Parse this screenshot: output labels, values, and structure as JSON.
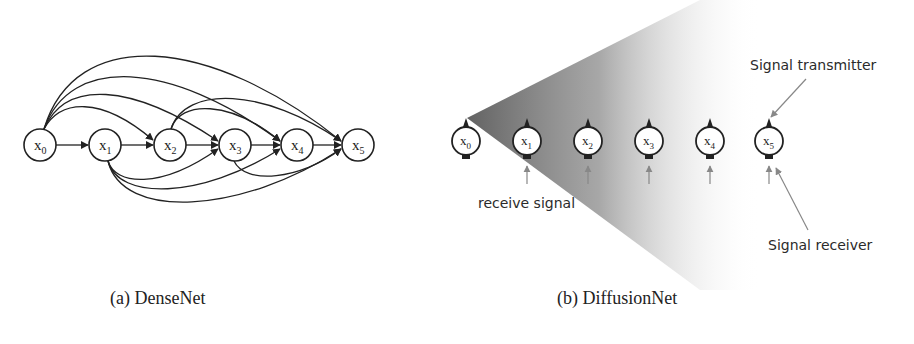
{
  "panels": {
    "densenet": {
      "caption": "(a) DenseNet",
      "nodes": [
        {
          "id": "x0",
          "base": "x",
          "sub": "0"
        },
        {
          "id": "x1",
          "base": "x",
          "sub": "1"
        },
        {
          "id": "x2",
          "base": "x",
          "sub": "2"
        },
        {
          "id": "x3",
          "base": "x",
          "sub": "3"
        },
        {
          "id": "x4",
          "base": "x",
          "sub": "4"
        },
        {
          "id": "x5",
          "base": "x",
          "sub": "5"
        }
      ],
      "edges": "every node connects to all subsequent nodes"
    },
    "diffusionnet": {
      "caption": "(b) DiffusionNet",
      "nodes": [
        {
          "id": "x0",
          "base": "x",
          "sub": "0"
        },
        {
          "id": "x1",
          "base": "x",
          "sub": "1"
        },
        {
          "id": "x2",
          "base": "x",
          "sub": "2"
        },
        {
          "id": "x3",
          "base": "x",
          "sub": "3"
        },
        {
          "id": "x4",
          "base": "x",
          "sub": "4"
        },
        {
          "id": "x5",
          "base": "x",
          "sub": "5"
        }
      ],
      "annotations": {
        "transmitter": "Signal transmitter",
        "receiver": "Signal receiver",
        "receive": "receive signal"
      }
    }
  }
}
